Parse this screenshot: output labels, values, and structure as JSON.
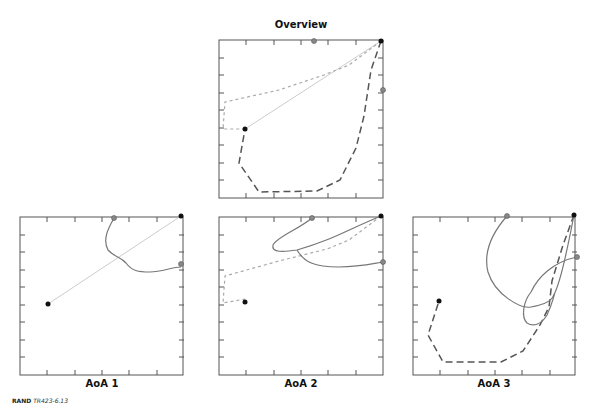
{
  "panels": {
    "overview": {
      "title": "Overview"
    },
    "aoa1": {
      "title": "AoA 1"
    },
    "aoa2": {
      "title": "AoA 2"
    },
    "aoa3": {
      "title": "AoA 3"
    }
  },
  "credit": {
    "org": "RAND",
    "id": "TR423-6.13"
  },
  "colors": {
    "frame": "#555555",
    "black_point": "#111111",
    "gray_point": "#888888",
    "solid_curve": "#777777",
    "light_line": "#cccccc",
    "dotted": "#aaaaaa",
    "dashed": "#555555"
  }
}
